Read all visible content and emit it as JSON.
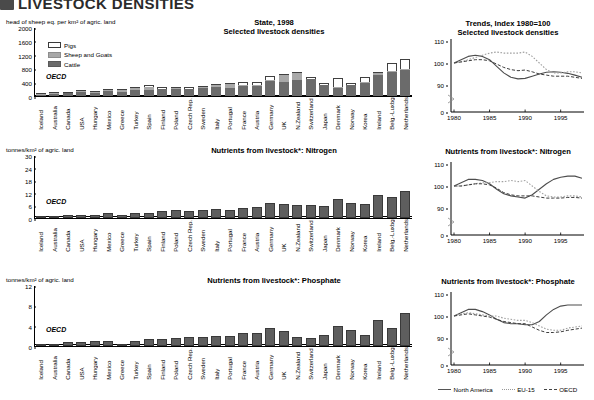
{
  "header": {
    "badge_icon": "section-badge-icon",
    "title": "LIVESTOCK DENSITIES"
  },
  "countries": [
    "Iceland",
    "Australia",
    "Canada",
    "USA",
    "Hungary",
    "Mexico",
    "Greece",
    "Turkey",
    "Spain",
    "Finland",
    "Poland",
    "Czech Rep.",
    "Sweden",
    "Italy",
    "Portugal",
    "France",
    "Austria",
    "Germany",
    "UK",
    "N.Zealand",
    "Switzerland",
    "Japan",
    "Denmark",
    "Norway",
    "Korea",
    "Ireland",
    "Belg.-Luxbg",
    "Netherlands"
  ],
  "oecd_label": "OECD",
  "panels": {
    "livestock_bar": {
      "title_line1": "State, 1998",
      "title_line2": "Selected livestock densities",
      "axis_label": "head of sheep eq. per km² of agric. land",
      "legend": [
        {
          "key": "pigs",
          "label": "Pigs"
        },
        {
          "key": "sheep",
          "label": "Sheep and Goats"
        },
        {
          "key": "cattle",
          "label": "Cattle"
        }
      ]
    },
    "nitrogen_bar": {
      "title": "Nutrients from livestock*: Nitrogen",
      "axis_label": "tonnes/km² of agric. land"
    },
    "phosphate_bar": {
      "title": "Nutrients from livestock*: Phosphate",
      "axis_label": "tonnes/km² of agric. land"
    },
    "livestock_trend": {
      "title_line1": "Trends, Index 1980=100",
      "title_line2": "Selected livestock densities"
    },
    "nitrogen_trend": {
      "title": "Nutrients from livestock*: Nitrogen"
    },
    "phosphate_trend": {
      "title": "Nutrients from livestock*: Phosphate"
    },
    "trend_legend": [
      {
        "key": "north-america",
        "label": "North America"
      },
      {
        "key": "eu-15",
        "label": "EU-15"
      },
      {
        "key": "oecd",
        "label": "OECD"
      }
    ]
  },
  "chart_data": [
    {
      "type": "bar",
      "id": "livestock-densities-1998",
      "title": "State, 1998 — Selected livestock densities",
      "xlabel": "",
      "ylabel": "head of sheep eq. per km² of agric. land",
      "ylim": [
        0,
        2000
      ],
      "yticks": [
        0,
        400,
        800,
        1200,
        1600,
        2000
      ],
      "grid": false,
      "stacked": true,
      "categories": [
        "Iceland",
        "Australia",
        "Canada",
        "USA",
        "Hungary",
        "Mexico",
        "Greece",
        "Turkey",
        "Spain",
        "Finland",
        "Poland",
        "Czech Rep.",
        "Sweden",
        "Italy",
        "Portugal",
        "France",
        "Austria",
        "Germany",
        "UK",
        "N.Zealand",
        "Switzerland",
        "Japan",
        "Denmark",
        "Norway",
        "Korea",
        "Ireland",
        "Belg.-Luxbg",
        "Netherlands"
      ],
      "series": [
        {
          "name": "Cattle",
          "values": [
            28,
            60,
            90,
            130,
            95,
            150,
            120,
            165,
            175,
            200,
            215,
            195,
            240,
            260,
            245,
            290,
            300,
            440,
            400,
            470,
            480,
            310,
            245,
            305,
            390,
            610,
            700,
            760
          ]
        },
        {
          "name": "Sheep and Goats",
          "values": [
            42,
            35,
            8,
            10,
            15,
            20,
            65,
            60,
            90,
            10,
            12,
            10,
            15,
            55,
            90,
            30,
            25,
            20,
            215,
            195,
            20,
            5,
            8,
            20,
            5,
            45,
            12,
            15
          ]
        },
        {
          "name": "Pigs",
          "values": [
            4,
            5,
            22,
            35,
            45,
            25,
            20,
            5,
            45,
            55,
            45,
            60,
            40,
            40,
            50,
            75,
            80,
            120,
            20,
            10,
            45,
            70,
            270,
            55,
            145,
            35,
            250,
            300
          ]
        }
      ],
      "oecd_reference": 70
    },
    {
      "type": "bar",
      "id": "nitrogen-from-livestock",
      "title": "Nutrients from livestock*: Nitrogen",
      "xlabel": "",
      "ylabel": "tonnes/km² of agric. land",
      "ylim": [
        0,
        30
      ],
      "yticks": [
        0,
        6,
        12,
        18,
        24,
        30
      ],
      "grid": false,
      "categories": [
        "Iceland",
        "Australia",
        "Canada",
        "USA",
        "Hungary",
        "Mexico",
        "Greece",
        "Turkey",
        "Spain",
        "Finland",
        "Poland",
        "Czech Rep.",
        "Sweden",
        "Italy",
        "Portugal",
        "France",
        "Austria",
        "Germany",
        "UK",
        "N.Zealand",
        "Switzerland",
        "Japan",
        "Denmark",
        "Norway",
        "Korea",
        "Ireland",
        "Belg.-Luxbg",
        "Netherlands"
      ],
      "values": [
        0.5,
        0.4,
        1.5,
        1.6,
        1.6,
        2.4,
        1.3,
        2.6,
        2.4,
        3.4,
        3.6,
        3.5,
        3.9,
        4.1,
        4.0,
        4.9,
        5.1,
        7.3,
        6.9,
        6.3,
        6.1,
        5.9,
        9.1,
        7.0,
        6.6,
        11.0,
        9.8,
        13.0,
        15.7
      ],
      "oecd_reference": 1.4
    },
    {
      "type": "bar",
      "id": "phosphate-from-livestock",
      "title": "Nutrients from livestock*: Phosphate",
      "xlabel": "",
      "ylabel": "tonnes/km² of agric. land",
      "ylim": [
        0,
        12
      ],
      "yticks": [
        0,
        4,
        8,
        12
      ],
      "grid": false,
      "categories": [
        "Iceland",
        "Australia",
        "Canada",
        "USA",
        "Hungary",
        "Mexico",
        "Greece",
        "Turkey",
        "Spain",
        "Finland",
        "Poland",
        "Czech Rep.",
        "Sweden",
        "Italy",
        "Portugal",
        "France",
        "Austria",
        "Germany",
        "UK",
        "N.Zealand",
        "Switzerland",
        "Japan",
        "Denmark",
        "Norway",
        "Korea",
        "Ireland",
        "Belg.-Luxbg",
        "Netherlands"
      ],
      "values": [
        0.15,
        0.12,
        0.7,
        0.85,
        0.9,
        0.95,
        0.3,
        1.0,
        1.3,
        1.45,
        1.55,
        1.7,
        1.7,
        2.0,
        1.95,
        2.5,
        2.55,
        3.6,
        2.95,
        1.7,
        1.55,
        2.25,
        4.0,
        3.2,
        2.2,
        5.1,
        3.5,
        6.4,
        7.6
      ],
      "oecd_reference": 0.5
    },
    {
      "type": "line",
      "id": "trend-livestock-densities",
      "title": "Trends, Index 1980=100 — Selected livestock densities",
      "xlabel": "",
      "ylabel": "Index 1980=100",
      "ylim": [
        0,
        110
      ],
      "yticks": [
        0,
        90,
        100,
        110
      ],
      "xlim": [
        1980,
        1998
      ],
      "xticks": [
        1980,
        1985,
        1990,
        1995
      ],
      "axis_break": true,
      "legend_position": "bottom",
      "x": [
        1980,
        1981,
        1982,
        1983,
        1984,
        1985,
        1986,
        1987,
        1988,
        1989,
        1990,
        1991,
        1992,
        1993,
        1994,
        1995,
        1996,
        1997,
        1998
      ],
      "series": [
        {
          "name": "North America",
          "values": [
            100,
            101.5,
            103,
            103.5,
            103,
            101.5,
            98.5,
            95.5,
            93.5,
            92.8,
            93,
            94,
            95,
            95.8,
            96,
            95.8,
            95.3,
            94.5,
            93.5
          ]
        },
        {
          "name": "EU-15",
          "values": [
            100,
            100.5,
            101.5,
            102.5,
            103.5,
            104.5,
            105,
            104.5,
            104.5,
            104.5,
            105,
            103,
            100,
            97,
            95.5,
            95.5,
            96,
            96,
            95.5
          ]
        },
        {
          "name": "OECD",
          "values": [
            100,
            100.5,
            101,
            101.5,
            101.5,
            101,
            99.5,
            98,
            97,
            96.5,
            96.8,
            96,
            95,
            94.5,
            94,
            94,
            94,
            93.5,
            93
          ]
        }
      ]
    },
    {
      "type": "line",
      "id": "trend-nitrogen",
      "title": "Nutrients from livestock*: Nitrogen",
      "xlabel": "",
      "ylabel": "Index 1980=100",
      "ylim": [
        0,
        110
      ],
      "yticks": [
        0,
        90,
        100,
        110
      ],
      "xlim": [
        1980,
        1998
      ],
      "xticks": [
        1980,
        1985,
        1990,
        1995
      ],
      "axis_break": true,
      "legend_position": "bottom",
      "x": [
        1980,
        1981,
        1982,
        1983,
        1984,
        1985,
        1986,
        1987,
        1988,
        1989,
        1990,
        1991,
        1992,
        1993,
        1994,
        1995,
        1996,
        1997,
        1998
      ],
      "series": [
        {
          "name": "North America",
          "values": [
            100,
            101.5,
            103,
            103,
            102.5,
            101,
            98.5,
            96.5,
            95.5,
            95,
            94.5,
            96,
            98.5,
            101,
            103,
            104,
            104.5,
            104.5,
            103.5
          ]
        },
        {
          "name": "EU-15",
          "values": [
            100,
            100,
            100.5,
            101,
            101.5,
            101.5,
            102,
            102,
            102.5,
            102,
            102.5,
            100,
            97.5,
            95.5,
            95,
            95,
            95.5,
            95.5,
            95
          ]
        },
        {
          "name": "OECD",
          "values": [
            100,
            100,
            100.5,
            101,
            101,
            100.5,
            99,
            97,
            96,
            95.5,
            95.5,
            95.5,
            95,
            94.5,
            94.5,
            94.5,
            94.8,
            94.8,
            94.5
          ]
        }
      ]
    },
    {
      "type": "line",
      "id": "trend-phosphate",
      "title": "Nutrients from livestock*: Phosphate",
      "xlabel": "",
      "ylabel": "Index 1980=100",
      "ylim": [
        0,
        110
      ],
      "yticks": [
        0,
        90,
        100,
        110
      ],
      "xlim": [
        1980,
        1998
      ],
      "xticks": [
        1980,
        1985,
        1990,
        1995
      ],
      "axis_break": true,
      "legend_position": "bottom",
      "x": [
        1980,
        1981,
        1982,
        1983,
        1984,
        1985,
        1986,
        1987,
        1988,
        1989,
        1990,
        1991,
        1992,
        1993,
        1994,
        1995,
        1996,
        1997,
        1998
      ],
      "series": [
        {
          "name": "North America",
          "values": [
            100,
            101.5,
            103,
            103,
            102,
            100.5,
            98.5,
            97,
            96.5,
            96.5,
            96,
            96,
            97.5,
            100.5,
            103,
            104.5,
            105,
            105,
            105
          ]
        },
        {
          "name": "EU-15",
          "values": [
            100,
            101,
            101.5,
            101,
            100.5,
            100,
            100,
            99,
            98.5,
            98,
            98,
            97,
            95.5,
            94,
            93.5,
            93.5,
            94.5,
            95,
            95.5
          ]
        },
        {
          "name": "OECD",
          "values": [
            100,
            100.5,
            101,
            100.5,
            100,
            99.5,
            98.5,
            97.5,
            97,
            96.5,
            96.5,
            95,
            93.5,
            92.5,
            92.5,
            92.8,
            93.5,
            94,
            94.5
          ]
        }
      ]
    }
  ]
}
